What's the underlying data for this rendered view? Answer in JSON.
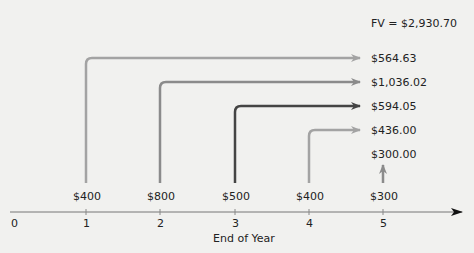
{
  "diagram": {
    "title_fv": "FV = $2,930.70",
    "axis_label": "End of Year",
    "ticks": [
      "0",
      "1",
      "2",
      "3",
      "4",
      "5"
    ],
    "deposits": [
      {
        "year": 1,
        "amount": "$400",
        "future_value": "$564.63",
        "color": "#a3a3a3"
      },
      {
        "year": 2,
        "amount": "$800",
        "future_value": "$1,036.02",
        "color": "#8b8b8b"
      },
      {
        "year": 3,
        "amount": "$500",
        "future_value": "$594.05",
        "color": "#555555"
      },
      {
        "year": 4,
        "amount": "$400",
        "future_value": "$436.00",
        "color": "#a3a3a3"
      },
      {
        "year": 5,
        "amount": "$300",
        "future_value": "$300.00",
        "color": "#8b8b8b"
      }
    ]
  }
}
